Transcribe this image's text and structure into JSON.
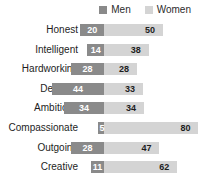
{
  "chart_data": {
    "type": "bar",
    "subtype": "diverging-horizontal-bar",
    "title": "",
    "subtitle": "",
    "xlabel": "",
    "ylabel": "",
    "grid": false,
    "legend_position": "top-right",
    "axis_origin": 0,
    "xlim": [
      -50,
      85
    ],
    "categories": [
      "Honest",
      "Intelligent",
      "Hardworking",
      "Decisive",
      "Ambitious",
      "Compassionate",
      "Outgoing",
      "Creative"
    ],
    "series": [
      {
        "name": "Men",
        "color": "#8a8a8a",
        "direction": "left",
        "values": [
          20,
          14,
          28,
          44,
          34,
          5,
          28,
          11
        ]
      },
      {
        "name": "Women",
        "color": "#d4d4d4",
        "direction": "right",
        "values": [
          50,
          38,
          28,
          33,
          34,
          80,
          47,
          62
        ]
      }
    ]
  },
  "legend": {
    "items": [
      {
        "label": "Men",
        "color": "#8a8a8a"
      },
      {
        "label": "Women",
        "color": "#d4d4d4"
      }
    ]
  }
}
